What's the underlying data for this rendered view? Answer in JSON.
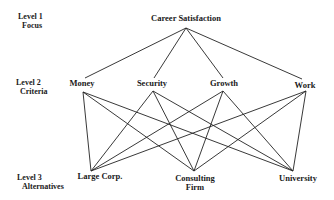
{
  "diagram": {
    "type": "hierarchy",
    "levels": [
      {
        "name": "Level 1",
        "subtitle": "Focus"
      },
      {
        "name": "Level 2",
        "subtitle": "Criteria"
      },
      {
        "name": "Level 3",
        "subtitle": "Alternatives"
      }
    ],
    "focus": {
      "label": "Career Satisfaction"
    },
    "criteria": [
      {
        "label": "Money"
      },
      {
        "label": "Security"
      },
      {
        "label": "Growth"
      },
      {
        "label": "Work"
      }
    ],
    "alternatives": [
      {
        "label": "Large Corp.",
        "line2": ""
      },
      {
        "label": "Consulting",
        "line2": "Firm"
      },
      {
        "label": "University",
        "line2": ""
      }
    ],
    "edges": {
      "focus_to_criteria": [
        [
          "Career Satisfaction",
          "Money"
        ],
        [
          "Career Satisfaction",
          "Security"
        ],
        [
          "Career Satisfaction",
          "Growth"
        ],
        [
          "Career Satisfaction",
          "Work"
        ]
      ],
      "criteria_to_alternatives": "all-to-all"
    }
  }
}
